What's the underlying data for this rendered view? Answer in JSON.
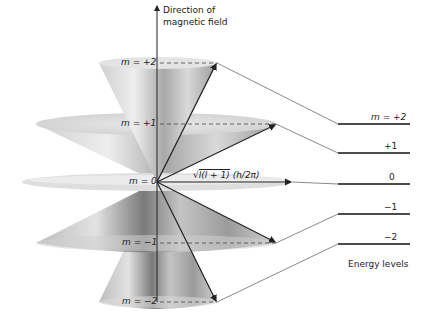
{
  "axis": {
    "title_line1": "Direction of",
    "title_line2": "magnetic field"
  },
  "cones": [
    {
      "m_label": "m = +2",
      "y": 63,
      "rx": 58
    },
    {
      "m_label": "m = +1",
      "y": 124,
      "rx": 120
    },
    {
      "m_label": "m = 0",
      "y": 182,
      "rx": 135
    },
    {
      "m_label": "m = −1",
      "y": 243,
      "rx": 120
    },
    {
      "m_label": "m = −2",
      "y": 302,
      "rx": 58
    }
  ],
  "vector_label": {
    "radical": "l(l + 1)",
    "factor": "(h/2π)",
    "sqrt_symbol": "√"
  },
  "energy_levels": {
    "title": "Energy levels",
    "levels": [
      {
        "label": "m = +2",
        "y": 124
      },
      {
        "label": "+1",
        "y": 153
      },
      {
        "label": "0",
        "y": 184
      },
      {
        "label": "−1",
        "y": 214
      },
      {
        "label": "−2",
        "y": 244
      }
    ]
  },
  "colors": {
    "cone_light": "#e6e6e6",
    "cone_dark": "#8a8a8a",
    "line": "#333333"
  }
}
